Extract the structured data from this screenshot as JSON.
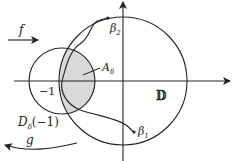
{
  "labels": {
    "f": "f",
    "g": "g",
    "minus_one": "−1",
    "disk": "𝔻",
    "A_delta": "A",
    "A_sub": "δ",
    "beta1": "β",
    "beta1_sub": "1",
    "beta2": "β",
    "beta2_sub": "2",
    "D_delta": "D",
    "D_sub": "δ",
    "D_arg": "(−1)"
  },
  "colors": {
    "stroke": "#222222",
    "shade": "#d9d9d9",
    "background": "#ffffff"
  }
}
